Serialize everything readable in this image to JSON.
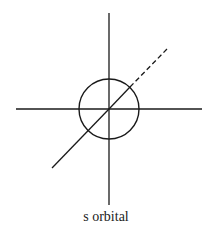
{
  "diagram": {
    "caption": "s orbital",
    "stroke_color": "#1a1a1a",
    "axes": {
      "vertical": {
        "x": 109,
        "y1": 13,
        "y2": 205
      },
      "horizontal": {
        "y": 109,
        "x1": 16,
        "x2": 202
      },
      "diagonal": {
        "x1": 52,
        "y1": 168,
        "x2": 109,
        "y2": 109,
        "dashed_x2": 167,
        "dashed_y2": 49
      }
    },
    "circle": {
      "cx": 109,
      "cy": 109,
      "r": 30
    }
  }
}
